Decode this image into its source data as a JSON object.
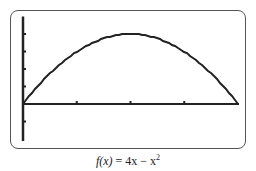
{
  "chart_data": {
    "type": "line",
    "title": "",
    "caption": "f(x) = 4x − x²",
    "function": "f(x) = 4x - x^2",
    "x": [
      0,
      0.5,
      1,
      1.5,
      2,
      2.5,
      3,
      3.5,
      4
    ],
    "values": [
      0,
      1.75,
      3,
      3.75,
      4,
      3.75,
      3,
      1.75,
      0
    ],
    "xlabel": "",
    "ylabel": "",
    "xlim": [
      0,
      4
    ],
    "ylim": [
      -2,
      5
    ],
    "x_ticks": [
      1,
      2,
      3
    ],
    "y_ticks": [
      -1,
      1,
      2,
      3,
      4
    ],
    "grid": false,
    "legend": null,
    "style": "graphing-calculator-screen"
  },
  "colors": {
    "curve": "#222222",
    "axes": "#222222",
    "frame": "#555555"
  },
  "caption": {
    "fx": "f(x)",
    "rest": " = 4x − x",
    "sup": "2"
  }
}
